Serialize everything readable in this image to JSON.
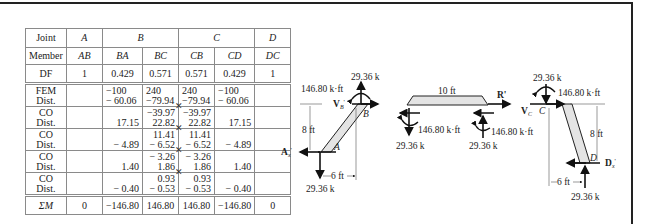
{
  "table": {
    "joint_header": {
      "label": "Joint",
      "joints": [
        "A",
        "B",
        "C",
        "D"
      ]
    },
    "member_row": {
      "label": "Member",
      "members": [
        "AB",
        "BA",
        "BC",
        "CB",
        "CD",
        "DC"
      ]
    },
    "df_row": {
      "label": "DF",
      "values": [
        "1",
        "0.429",
        "0.571",
        "0.571",
        "0.429",
        "1"
      ]
    },
    "steps": [
      {
        "label1": "FEM",
        "label2": "Dist.",
        "cells": [
          [
            "",
            ""
          ],
          [
            "−100",
            "− 60.06"
          ],
          [
            "240",
            "−79.94"
          ],
          [
            "240",
            "−79.94"
          ],
          [
            "−100",
            "− 60.06"
          ],
          [
            "",
            ""
          ]
        ]
      },
      {
        "label1": "CO",
        "label2": "Dist.",
        "cells": [
          [
            "",
            ""
          ],
          [
            "",
            "17.15"
          ],
          [
            "−39.97",
            "22.82"
          ],
          [
            "−39.97",
            "22.82"
          ],
          [
            "",
            "17.15"
          ],
          [
            "",
            ""
          ]
        ]
      },
      {
        "label1": "CO",
        "label2": "Dist.",
        "cells": [
          [
            "",
            ""
          ],
          [
            "",
            "− 4.89"
          ],
          [
            "11.41",
            "− 6.52"
          ],
          [
            "11.41",
            "− 6.52"
          ],
          [
            "",
            "− 4.89"
          ],
          [
            "",
            ""
          ]
        ]
      },
      {
        "label1": "CO",
        "label2": "Dist.",
        "cells": [
          [
            "",
            ""
          ],
          [
            "",
            "1.40"
          ],
          [
            "− 3.26",
            "1.86"
          ],
          [
            "− 3.26",
            "1.86"
          ],
          [
            "",
            "1.40"
          ],
          [
            "",
            ""
          ]
        ]
      },
      {
        "label1": "CO",
        "label2": "Dist.",
        "cells": [
          [
            "",
            ""
          ],
          [
            "",
            "− 0.40"
          ],
          [
            "0.93",
            "− 0.53"
          ],
          [
            "0.93",
            "− 0.53"
          ],
          [
            "",
            "− 0.40"
          ],
          [
            "",
            ""
          ]
        ]
      }
    ],
    "sum_row": {
      "label": "ΣM",
      "values": [
        "0",
        "−146.80",
        "146.80",
        "146.80",
        "−146.80",
        "0"
      ]
    },
    "carryover_marker": "✕"
  },
  "diagrams": {
    "column_ab": {
      "top_force": "29.36 k",
      "moment": "146.80 k·ft",
      "shear_label": "V",
      "shear_sub": "B",
      "shear_prime": "'",
      "joint_top": "B",
      "joint_bottom": "A",
      "height": "8 ft",
      "reaction_label": "A",
      "reaction_sub": "x",
      "reaction_prime": "'",
      "offset": "6 ft",
      "bottom_force": "29.36 k"
    },
    "beam_bc": {
      "span": "10 ft",
      "r_label": "R'",
      "left_moment": "146.80 k·ft",
      "left_force": "29.36 k",
      "right_moment": "146.80 k·ft",
      "right_force": "29.36 k"
    },
    "column_cd": {
      "top_force": "29.36 k",
      "moment": "146.80 k·ft",
      "shear_label": "V",
      "shear_sub": "C",
      "joint_top": "C",
      "joint_bottom": "D",
      "height": "8 ft",
      "reaction_label": "D",
      "reaction_sub": "x",
      "reaction_prime": "'",
      "offset": "6 ft",
      "bottom_force": "29.36 k"
    }
  }
}
